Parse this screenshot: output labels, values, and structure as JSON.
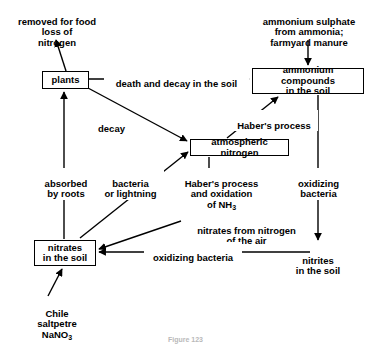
{
  "diagram": {
    "caption": "Figure 123",
    "line_color": "#000000",
    "text_color": "#000000",
    "background": "#ffffff",
    "nodes": [
      {
        "id": "plants",
        "label": "plants",
        "boxed": true,
        "x": 42,
        "y": 71,
        "w": 47,
        "h": 18
      },
      {
        "id": "ammonium-compounds",
        "label": "ammonium compounds\nin the soil",
        "boxed": true,
        "x": 252,
        "y": 68,
        "w": 112,
        "h": 26
      },
      {
        "id": "atmospheric-nitrogen",
        "label": "atmospheric nitrogen",
        "boxed": true,
        "x": 190,
        "y": 139,
        "w": 99,
        "h": 17
      },
      {
        "id": "nitrates-in-the-soil",
        "label": "nitrates\nin the soil",
        "boxed": true,
        "x": 34,
        "y": 240,
        "w": 62,
        "h": 26
      }
    ],
    "free_labels": [
      {
        "id": "removed-for-food",
        "label": "removed for food\nloss of\nnitrogen",
        "x": 5,
        "y": 6,
        "w": 104
      },
      {
        "id": "ammonium-sulphate-source",
        "label": "ammonium sulphate\nfrom ammonia;\nfarmyard manure",
        "x": 254,
        "y": 6,
        "w": 110
      },
      {
        "id": "nitrites-in-the-soil",
        "label": "nitrites\nin the soil",
        "x": 286,
        "y": 245,
        "w": 64
      },
      {
        "id": "chile-saltpetre",
        "label": "Chile\nsaltpetre\nNaNO",
        "sub": "3",
        "x": 24,
        "y": 298,
        "w": 66
      }
    ],
    "edge_labels": [
      {
        "id": "death-and-decay",
        "label": "death and decay in the soil",
        "x": 104,
        "y": 68,
        "w": 143
      },
      {
        "id": "decay",
        "label": "decay",
        "x": 92,
        "y": 113,
        "w": 37
      },
      {
        "id": "habers-process",
        "label": "Haber's process",
        "x": 230,
        "y": 110,
        "w": 86
      },
      {
        "id": "absorbed-by-roots",
        "label": "absorbed\nby roots",
        "x": 38,
        "y": 168,
        "w": 54
      },
      {
        "id": "bacteria-or-lightning",
        "label": "bacteria\nor lightning",
        "x": 97,
        "y": 168,
        "w": 65
      },
      {
        "id": "habers-process-oxidation",
        "label": "Haber's process\nand oxidation\nof NH",
        "sub": "3",
        "x": 173,
        "y": 168,
        "w": 95
      },
      {
        "id": "oxidizing-bacteria-right",
        "label": "oxidizing\nbacteria",
        "x": 290,
        "y": 168,
        "w": 55
      },
      {
        "id": "nitrates-from-nitrogen-of-the-air",
        "label": "nitrates from nitrogen\nof the air",
        "x": 183,
        "y": 215,
        "w": 125
      },
      {
        "id": "oxidizing-bacteria-bottom",
        "label": "oxidizing bacteria",
        "x": 144,
        "y": 242,
        "w": 96
      }
    ],
    "edges": [
      {
        "id": "plants-to-removed-for-food",
        "from": "plants",
        "to": "removed-for-food",
        "label": ""
      },
      {
        "id": "plants-to-ammonium-compounds",
        "from": "plants",
        "to": "ammonium-compounds",
        "label": "death and decay in the soil"
      },
      {
        "id": "plants-to-atmospheric-nitrogen",
        "from": "plants",
        "to": "atmospheric-nitrogen",
        "label": "decay"
      },
      {
        "id": "ammonium-sulphate-to-ammonium-compounds",
        "from": "ammonium-sulphate-source",
        "to": "ammonium-compounds",
        "label": ""
      },
      {
        "id": "atmospheric-nitrogen-to-ammonium-compounds",
        "from": "atmospheric-nitrogen",
        "to": "ammonium-compounds",
        "label": "Haber's process"
      },
      {
        "id": "nitrates-to-plants",
        "from": "nitrates-in-the-soil",
        "to": "plants",
        "label": "absorbed by roots"
      },
      {
        "id": "nitrates-to-atmospheric-nitrogen",
        "from": "nitrates-in-the-soil",
        "to": "atmospheric-nitrogen",
        "label": "bacteria or lightning"
      },
      {
        "id": "atmospheric-nitrogen-to-nitrates",
        "from": "atmospheric-nitrogen",
        "to": "nitrates-in-the-soil",
        "label": "Haber's process and oxidation of NH3 / nitrates from nitrogen of the air"
      },
      {
        "id": "ammonium-compounds-to-nitrites",
        "from": "ammonium-compounds",
        "to": "nitrites-in-the-soil",
        "label": "oxidizing bacteria"
      },
      {
        "id": "nitrites-to-nitrates",
        "from": "nitrites-in-the-soil",
        "to": "nitrates-in-the-soil",
        "label": "oxidizing bacteria"
      },
      {
        "id": "chile-saltpetre-to-nitrates",
        "from": "chile-saltpetre",
        "to": "nitrates-in-the-soil",
        "label": ""
      }
    ]
  }
}
